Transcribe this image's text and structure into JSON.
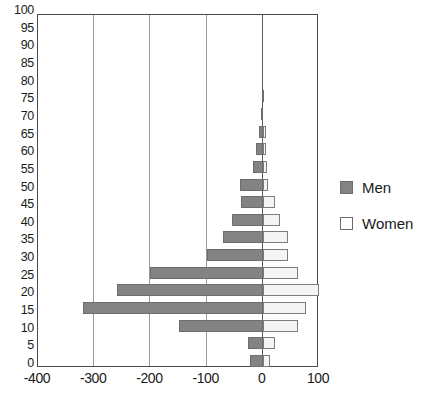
{
  "chart_data": {
    "type": "bar",
    "subtype": "population-pyramid",
    "title": "",
    "xlabel": "",
    "ylabel": "",
    "orientation": "horizontal",
    "grid": true,
    "legend_position": "right",
    "xlim": [
      -400,
      100
    ],
    "xticks": [
      -400,
      -300,
      -200,
      -100,
      0,
      100
    ],
    "xtick_labels": [
      "-400",
      "-300",
      "-200",
      "-100",
      "0",
      "100"
    ],
    "ylim": [
      0,
      100
    ],
    "yticks": [
      0,
      5,
      10,
      15,
      20,
      25,
      30,
      35,
      40,
      45,
      50,
      55,
      60,
      65,
      70,
      75,
      80,
      85,
      90,
      95,
      100
    ],
    "ytick_labels": [
      "0",
      "5",
      "10",
      "15",
      "20",
      "25",
      "30",
      "35",
      "40",
      "45",
      "50",
      "55",
      "60",
      "65",
      "70",
      "75",
      "80",
      "85",
      "90",
      "95",
      "100"
    ],
    "categories": [
      0,
      5,
      10,
      15,
      20,
      25,
      30,
      35,
      40,
      45,
      50,
      55,
      60,
      65,
      70,
      75,
      80,
      85,
      90,
      95,
      100
    ],
    "series": [
      {
        "name": "Men",
        "color": "#838383",
        "values": [
          -23,
          -26,
          -150,
          -320,
          -260,
          -200,
          -100,
          -70,
          -55,
          -38,
          -40,
          -18,
          -12,
          -6,
          -3,
          -1,
          0,
          0,
          0,
          0,
          0
        ]
      },
      {
        "name": "Women",
        "color": "#f4f4f4",
        "values": [
          13,
          22,
          62,
          76,
          100,
          62,
          45,
          45,
          30,
          22,
          10,
          8,
          6,
          5,
          0,
          0,
          0,
          0,
          0,
          0,
          0
        ]
      }
    ]
  },
  "legend": {
    "items": [
      {
        "label": "Men",
        "swatch": "men"
      },
      {
        "label": "Women",
        "swatch": "women"
      }
    ]
  }
}
